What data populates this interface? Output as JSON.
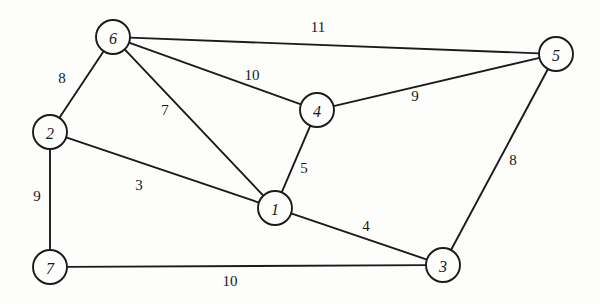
{
  "figure": {
    "background_color": "#fdfdfc",
    "stroke_color": "#1b1b1b",
    "text_color": "#171717",
    "width": 600,
    "height": 304
  },
  "chart_data": {
    "type": "diagram",
    "diagram_kind": "undirected-weighted-graph",
    "title": "",
    "xlabel": "",
    "ylabel": "",
    "node_radius": 17,
    "nodes": [
      {
        "id": "6",
        "label": "6",
        "x": 113,
        "y": 37
      },
      {
        "id": "5",
        "label": "5",
        "x": 556,
        "y": 54
      },
      {
        "id": "4",
        "label": "4",
        "x": 317,
        "y": 110
      },
      {
        "id": "2",
        "label": "2",
        "x": 50,
        "y": 132
      },
      {
        "id": "1",
        "label": "1",
        "x": 275,
        "y": 208
      },
      {
        "id": "7",
        "label": "7",
        "x": 50,
        "y": 267
      },
      {
        "id": "3",
        "label": "3",
        "x": 443,
        "y": 265
      }
    ],
    "edges": [
      {
        "source": "6",
        "target": "5",
        "weight": 11,
        "label": "11",
        "label_x": 318,
        "label_y": 27
      },
      {
        "source": "6",
        "target": "4",
        "weight": 10,
        "label": "10",
        "label_x": 252,
        "label_y": 75
      },
      {
        "source": "6",
        "target": "2",
        "weight": 8,
        "label": "8",
        "label_x": 62,
        "label_y": 78
      },
      {
        "source": "6",
        "target": "1",
        "weight": 7,
        "label": "7",
        "label_x": 165,
        "label_y": 110
      },
      {
        "source": "4",
        "target": "5",
        "weight": 9,
        "label": "9",
        "label_x": 415,
        "label_y": 96
      },
      {
        "source": "4",
        "target": "1",
        "weight": 5,
        "label": "5",
        "label_x": 304,
        "label_y": 168
      },
      {
        "source": "2",
        "target": "1",
        "weight": 3,
        "label": "3",
        "label_x": 139,
        "label_y": 185
      },
      {
        "source": "2",
        "target": "7",
        "weight": 9,
        "label": "9",
        "label_x": 37,
        "label_y": 196
      },
      {
        "source": "1",
        "target": "3",
        "weight": 4,
        "label": "4",
        "label_x": 366,
        "label_y": 226
      },
      {
        "source": "7",
        "target": "3",
        "weight": 10,
        "label": "10",
        "label_x": 230,
        "label_y": 281
      },
      {
        "source": "5",
        "target": "3",
        "weight": 8,
        "label": "8",
        "label_x": 513,
        "label_y": 160
      }
    ]
  }
}
